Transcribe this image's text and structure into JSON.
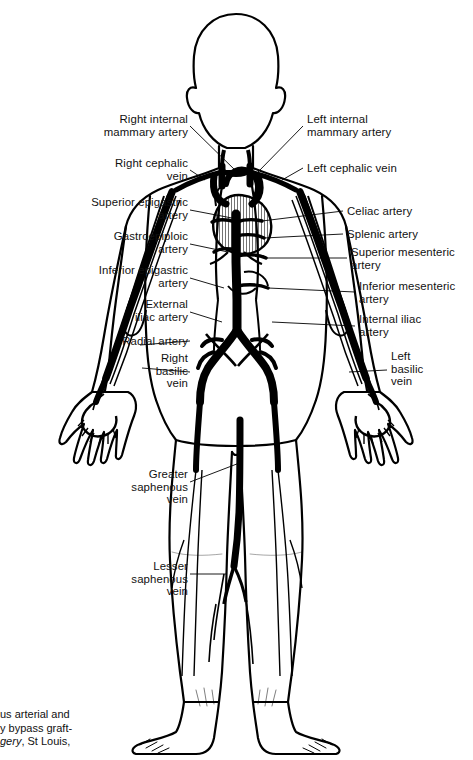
{
  "figure": {
    "view": "anterior full-body",
    "line_color": "#000000",
    "background_color": "#ffffff",
    "style": "black-and-white line art"
  },
  "labels_left": [
    {
      "name": "right-internal-mammary-artery",
      "text": "Right internal\nmammary artery",
      "x": 60,
      "y": 113,
      "w": 128,
      "lead": [
        [
          190,
          126
        ],
        [
          237,
          172
        ]
      ]
    },
    {
      "name": "right-cephalic-vein",
      "text": "Right cephalic\nvein",
      "x": 60,
      "y": 157,
      "w": 128,
      "lead": [
        [
          190,
          170
        ],
        [
          205,
          180
        ]
      ]
    },
    {
      "name": "superior-epigastric-artery",
      "text": "Superior epigastric\nartery",
      "x": 34,
      "y": 196,
      "w": 154,
      "lead": [
        [
          190,
          210
        ],
        [
          232,
          218
        ]
      ]
    },
    {
      "name": "gastroepiploic-artery",
      "text": "Gastroepiploic\nartery",
      "x": 50,
      "y": 230,
      "w": 138,
      "lead": [
        [
          190,
          244
        ],
        [
          228,
          252
        ]
      ]
    },
    {
      "name": "inferior-epigastric-artery",
      "text": "Inferior epigastric\nartery",
      "x": 34,
      "y": 264,
      "w": 154,
      "lead": [
        [
          190,
          278
        ],
        [
          224,
          288
        ]
      ]
    },
    {
      "name": "external-iliac-artery",
      "text": "External\niliac artery",
      "x": 60,
      "y": 298,
      "w": 128,
      "lead": [
        [
          190,
          312
        ],
        [
          222,
          322
        ]
      ]
    },
    {
      "name": "radial-artery",
      "text": "Radial artery",
      "x": 48,
      "y": 335,
      "w": 140,
      "lead": [
        [
          190,
          341
        ],
        [
          140,
          345
        ]
      ]
    },
    {
      "name": "right-basilic-vein",
      "text": "Right\nbasilic\nvein",
      "x": 60,
      "y": 352,
      "w": 128,
      "lead": [
        [
          190,
          372
        ],
        [
          142,
          368
        ]
      ]
    },
    {
      "name": "greater-saphenous-vein",
      "text": "Greater\nsaphenous\nvein",
      "x": 92,
      "y": 468,
      "w": 96,
      "lead": [
        [
          190,
          482
        ],
        [
          242,
          462
        ]
      ]
    },
    {
      "name": "lesser-saphenous-vein",
      "text": "Lesser\nsaphenous\nvein",
      "x": 92,
      "y": 560,
      "w": 96,
      "lead": [
        [
          190,
          574
        ],
        [
          226,
          574
        ]
      ]
    }
  ],
  "labels_right": [
    {
      "name": "left-internal-mammary-artery",
      "text": "Left internal\nmammary artery",
      "x": 307,
      "y": 113,
      "lead": [
        [
          303,
          126
        ],
        [
          258,
          172
        ]
      ]
    },
    {
      "name": "left-cephalic-vein",
      "text": "Left cephalic vein",
      "x": 307,
      "y": 162,
      "lead": [
        [
          303,
          168
        ],
        [
          282,
          180
        ]
      ]
    },
    {
      "name": "celiac-artery",
      "text": "Celiac artery",
      "x": 347,
      "y": 205,
      "lead": [
        [
          343,
          211
        ],
        [
          262,
          221
        ]
      ]
    },
    {
      "name": "splenic-artery",
      "text": "Splenic artery",
      "x": 347,
      "y": 228,
      "lead": [
        [
          343,
          234
        ],
        [
          264,
          238
        ]
      ]
    },
    {
      "name": "superior-mesenteric-artery",
      "text": "Superior mesenteric\nartery",
      "x": 351,
      "y": 246,
      "lead": [
        [
          347,
          258
        ],
        [
          266,
          258
        ]
      ]
    },
    {
      "name": "inferior-mesenteric-artery",
      "text": "Inferior mesenteric\nartery",
      "x": 359,
      "y": 280,
      "lead": [
        [
          355,
          292
        ],
        [
          268,
          288
        ]
      ]
    },
    {
      "name": "internal-iliac-artery",
      "text": "Internal iliac\nartery",
      "x": 359,
      "y": 313,
      "lead": [
        [
          355,
          326
        ],
        [
          272,
          322
        ]
      ]
    },
    {
      "name": "left-basilic-vein",
      "text": "Left\nbasilic\nvein",
      "x": 391,
      "y": 350,
      "lead": [
        [
          387,
          370
        ],
        [
          349,
          372
        ]
      ]
    }
  ],
  "caption": {
    "name": "source-caption",
    "lines": [
      {
        "text": "us arterial and"
      },
      {
        "text": "y bypass graft-"
      },
      {
        "text": "gery, St Louis,",
        "italic_prefix": "gery"
      }
    ],
    "note": "text clipped at left page margin",
    "x": 0,
    "y": 708
  }
}
